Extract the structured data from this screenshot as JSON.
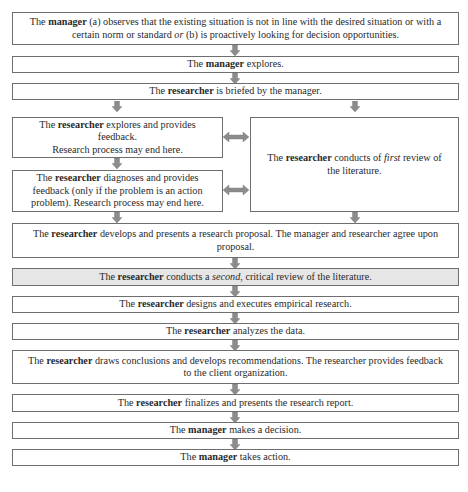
{
  "diagram": {
    "type": "flowchart",
    "arrow_color": "#8c8c8c",
    "border_color": "#6e6e6e",
    "highlight_fill": "#e6e6e6",
    "steps": [
      {
        "id": "s1",
        "pre": "The ",
        "bold": "manager",
        "post": " (a) observes that the existing situation is not in line with the desired situation or with a certain norm or standard ",
        "italic": "or",
        "post2": " (b) is proactively looking for decision opportunities."
      },
      {
        "id": "s2",
        "pre": "The ",
        "bold": "manager",
        "post": " explores."
      },
      {
        "id": "s3",
        "pre": "The ",
        "bold": "researcher",
        "post": " is briefed by the manager."
      },
      {
        "id": "s4a",
        "pre": "The ",
        "bold": "researcher",
        "post": " explores and provides feedback.",
        "line2": "Research process may end here."
      },
      {
        "id": "s4b",
        "pre": "The ",
        "bold": "researcher",
        "post": " diagnoses and provides feedback (only if the problem is an action problem). Research process may end here."
      },
      {
        "id": "s4r",
        "pre": "The ",
        "bold": "researcher",
        "post": " conducts of ",
        "italic": "first",
        "post2": " review of the literature."
      },
      {
        "id": "s5",
        "pre": "The ",
        "bold": "researcher",
        "post": " develops and presents a research proposal. The manager and researcher agree upon proposal."
      },
      {
        "id": "s6",
        "pre": "The ",
        "bold": "researcher",
        "post": " conducts a ",
        "italic": "second",
        "post2": ", critical review of the literature.",
        "highlighted": true
      },
      {
        "id": "s7",
        "pre": "The ",
        "bold": "researcher",
        "post": " designs and executes empirical research."
      },
      {
        "id": "s8",
        "pre": "The ",
        "bold": "researcher",
        "post": " analyzes the data."
      },
      {
        "id": "s9",
        "pre": "The ",
        "bold": "researcher",
        "post": " draws conclusions and develops recommendations. The researcher provides feedback to the client organization."
      },
      {
        "id": "s10",
        "pre": "The ",
        "bold": "researcher",
        "post": " finalizes and presents the research report."
      },
      {
        "id": "s11",
        "pre": "The ",
        "bold": "manager",
        "post": " makes a decision."
      },
      {
        "id": "s12",
        "pre": "The ",
        "bold": "manager",
        "post": " takes action."
      }
    ]
  }
}
